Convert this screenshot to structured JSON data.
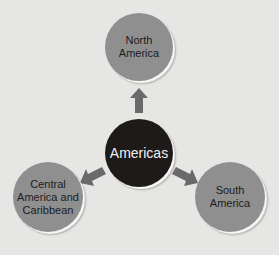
{
  "diagram": {
    "center": {
      "label": "Americas",
      "color": "#1e1a1a"
    },
    "nodes": [
      {
        "label": "North America",
        "color": "#8f8f8f"
      },
      {
        "label": "Central America and Caribbean",
        "color": "#8f8f8f"
      },
      {
        "label": "South America",
        "color": "#8f8f8f"
      }
    ],
    "arrow_color": "#6a6a6a",
    "background": "#e6e6e4"
  }
}
